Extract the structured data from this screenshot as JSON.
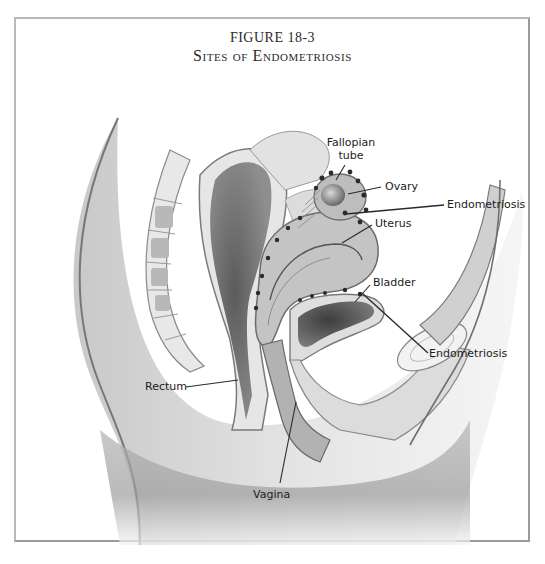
{
  "figure": {
    "number": "FIGURE 18-3",
    "title": "Sites of Endometriosis"
  },
  "labels": {
    "fallopian_tube_line1": "Fallopian",
    "fallopian_tube_line2": "tube",
    "ovary": "Ovary",
    "endometriosis_upper": "Endometriosis",
    "uterus": "Uterus",
    "bladder": "Bladder",
    "endometriosis_lower": "Endometriosis",
    "rectum": "Rectum",
    "vagina": "Vagina"
  },
  "colors": {
    "frame": "#b9b9b9",
    "text": "#1c1c1c",
    "tissue_light": "#d9d9d9",
    "tissue_mid": "#a8a8a8",
    "tissue_dark": "#555555",
    "lesion": "#2b2b2b"
  }
}
